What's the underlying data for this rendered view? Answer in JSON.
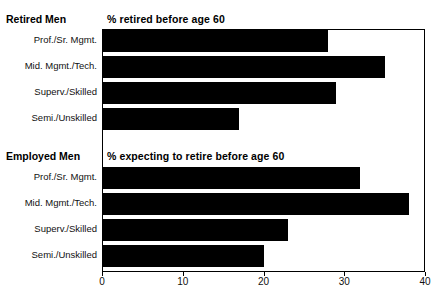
{
  "chart_data": {
    "type": "bar",
    "orientation": "horizontal",
    "title": "",
    "xlabel": "",
    "ylabel": "",
    "xlim": [
      0,
      40
    ],
    "xticks": [
      0,
      10,
      20,
      30,
      40
    ],
    "xtick_labels": [
      "0",
      "10",
      "20",
      "30",
      "40"
    ],
    "grid": false,
    "legend": "none",
    "bar_color": "#000000",
    "frame_color": "#000000",
    "panels": [
      {
        "group_label": "Retired Men",
        "panel_title": "% retired before age 60",
        "categories": [
          "Prof./Sr. Mgmt.",
          "Mid. Mgmt./Tech.",
          "Superv./Skilled",
          "Semi./Unskilled"
        ],
        "values": [
          28,
          35,
          29,
          17
        ]
      },
      {
        "group_label": "Employed Men",
        "panel_title": "% expecting to retire before age 60",
        "categories": [
          "Prof./Sr. Mgmt.",
          "Mid. Mgmt./Tech.",
          "Superv./Skilled",
          "Semi./Unskilled"
        ],
        "values": [
          32,
          38,
          23,
          20
        ]
      }
    ]
  }
}
